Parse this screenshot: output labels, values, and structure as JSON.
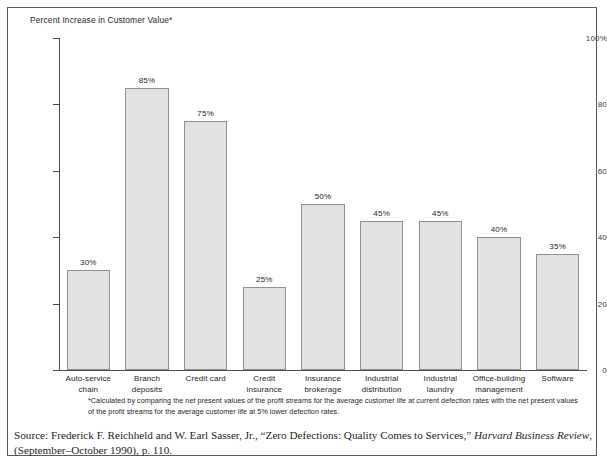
{
  "exhibit": {
    "title": "Percent Increase in Customer Value*",
    "footnote": "*Calculated by comparing the net present values of the profit streams for the average customer life at current defection rates with the net present values of the profit streams for the average customer life at 5% lower defection rates.",
    "source_prefix": "Source: Frederick F. Reichheld and W. Earl Sasser, Jr., “Zero Defections: Quality Comes to Services,” ",
    "source_italic": "Harvard Business Review",
    "source_suffix": ", (September–October 1990), p. 110."
  },
  "colors": {
    "bar_fill": "#e2e2e2",
    "bar_stroke": "#8f8f8f",
    "axis": "#4d4d4d",
    "text": "#231f20",
    "frame": "#5a5a5a"
  },
  "chart_data": {
    "type": "bar",
    "title": "Percent Increase in Customer Value*",
    "xlabel": "",
    "ylabel": "",
    "ylim": [
      0,
      100
    ],
    "yticks": [
      0,
      20,
      40,
      60,
      80,
      100
    ],
    "ytick_labels": [
      "0",
      "20",
      "40",
      "60",
      "80",
      "100%"
    ],
    "grid": false,
    "legend": "none",
    "categories": [
      "Auto-service chain",
      "Branch deposits",
      "Credit card",
      "Credit insurance",
      "Insurance brokerage",
      "Industrial distribution",
      "Industrial laundry",
      "Office-building management",
      "Software"
    ],
    "category_lines": [
      [
        "Auto-service",
        "chain"
      ],
      [
        "Branch deposits"
      ],
      [
        "Credit card"
      ],
      [
        "Credit insurance"
      ],
      [
        "Insurance",
        "brokerage"
      ],
      [
        "Industrial",
        "distribution"
      ],
      [
        "Industrial",
        "laundry"
      ],
      [
        "Office-building",
        "management"
      ],
      [
        "Software"
      ]
    ],
    "values": [
      30,
      85,
      75,
      25,
      50,
      45,
      45,
      40,
      35
    ],
    "data_labels": [
      "30%",
      "85%",
      "75%",
      "25%",
      "50%",
      "45%",
      "45%",
      "40%",
      "35%"
    ]
  }
}
